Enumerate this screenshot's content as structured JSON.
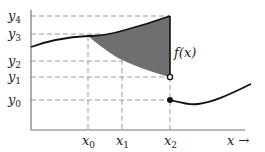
{
  "diagram": {
    "y_labels": [
      {
        "base": "y",
        "sub": "4",
        "y": 16
      },
      {
        "base": "y",
        "sub": "3",
        "y": 34
      },
      {
        "base": "y",
        "sub": "2",
        "y": 61
      },
      {
        "base": "y",
        "sub": "1",
        "y": 77
      },
      {
        "base": "y",
        "sub": "0",
        "y": 100
      }
    ],
    "x_labels": [
      {
        "base": "x",
        "sub": "0",
        "x": 88
      },
      {
        "base": "x",
        "sub": "1",
        "x": 122
      },
      {
        "base": "x",
        "sub": "2",
        "x": 170
      }
    ],
    "function_label": "f(x)",
    "x_axis_label": "x →",
    "colors": {
      "curve": "#111111",
      "fill": "#6f6f6f",
      "dash": "#9a9a9a",
      "axis": "#777777"
    }
  }
}
